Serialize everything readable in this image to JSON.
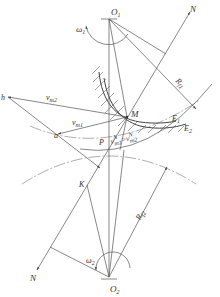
{
  "diagram": {
    "type": "gear-tooth-contact-velocity-diagram",
    "labels": {
      "O1": {
        "main": "O",
        "sub": "1"
      },
      "O2": {
        "main": "O",
        "sub": "2"
      },
      "omega1": {
        "main": "ω",
        "sub": "1"
      },
      "omega2": {
        "main": "ω",
        "sub": "2"
      },
      "N_top": "N",
      "N_bottom": "N",
      "Rf1": {
        "main": "R",
        "sub": "f1"
      },
      "Rf2": {
        "main": "R",
        "sub": "f2"
      },
      "M": "M",
      "E1": {
        "main": "E",
        "sub": "1"
      },
      "E2": {
        "main": "E",
        "sub": "2"
      },
      "h": "h",
      "a": "a",
      "P": "P",
      "K": "K",
      "vm2": {
        "main": "v",
        "sub": "m2"
      },
      "vm1": {
        "main": "v",
        "sub": "m1"
      },
      "vN_equation": {
        "left_main": "v",
        "left_sup": "N",
        "left_sub": "m1",
        "eq": "=",
        "right_main": "v",
        "right_sup": "N",
        "right_sub": "m2"
      }
    },
    "colors": {
      "line": "#555555",
      "text": "#333333",
      "background": "#ffffff"
    }
  }
}
